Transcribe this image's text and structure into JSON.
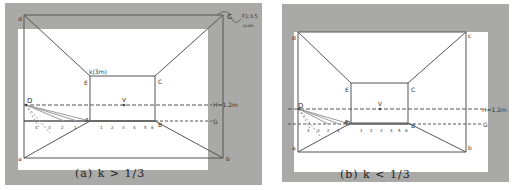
{
  "figure": {
    "panels": [
      {
        "id": "a",
        "caption": "(a) k > 1/3",
        "labels": {
          "top_left": "d",
          "top_right": "c",
          "bottom_left": "a",
          "bottom_right": "b",
          "E": "E",
          "C": "C",
          "A": "A",
          "B": "B",
          "D": "D",
          "V": "V",
          "E_note": "k(3m)",
          "H_line": "H=1.2m",
          "G_line": "G",
          "corner_note_1": "F1:3.5",
          "corner_note_2": "scale"
        },
        "ground_ticks": [
          "1",
          "2",
          "3",
          "4",
          "5",
          "6"
        ],
        "left_ticks": [
          "4",
          "3",
          "2",
          "1"
        ]
      },
      {
        "id": "b",
        "caption": "(b) k < 1/3",
        "labels": {
          "top_left": "d",
          "top_right": "c",
          "bottom_left": "a",
          "bottom_right": "b",
          "E": "E",
          "C": "C",
          "A": "A",
          "B": "B",
          "D": "D",
          "V": "V",
          "H_line": "H=1.2m",
          "G_line": "G"
        },
        "ground_ticks": [
          "1",
          "2",
          "3",
          "4",
          "5",
          "6"
        ],
        "left_ticks": [
          "4",
          "3",
          "2",
          "1"
        ]
      }
    ],
    "colors": {
      "background_paper": "#a9a9a7",
      "sheet": "#ffffff",
      "ink": "#444444"
    }
  }
}
